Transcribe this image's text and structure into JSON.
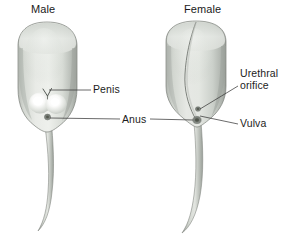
{
  "figure": {
    "caption_titles": {
      "male": "Male",
      "female": "Female"
    },
    "labels": {
      "penis": "Penis",
      "anus": "Anus",
      "urethral_orifice_line1": "Urethral",
      "urethral_orifice_line2": "orifice",
      "vulva": "Vulva"
    },
    "colors": {
      "background": "#ffffff",
      "body_light": "#e8eae6",
      "body_mid": "#cfd3cd",
      "body_shadow": "#a9aea8",
      "outline": "#6e736e",
      "leader_line": "#3a3a3a",
      "text": "#1c1c1c",
      "testis_highlight": "#ffffff",
      "orifice_dark": "#5a5f5a"
    }
  }
}
